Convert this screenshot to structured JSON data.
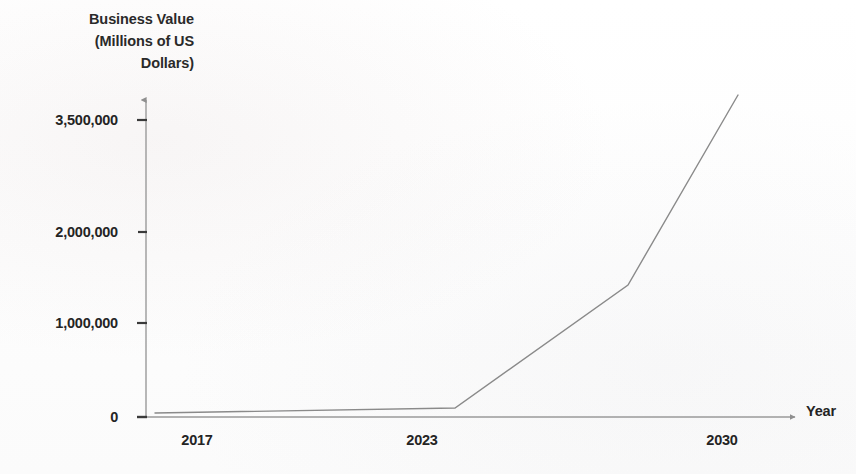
{
  "chart_data": {
    "type": "line",
    "title": "Business Value (Millions of US Dollars)",
    "ylabel_lines": [
      "Business Value",
      "(Millions of US",
      "Dollars)"
    ],
    "xlabel": "Year",
    "ylabel": "Business Value (Millions of US Dollars)",
    "grid": false,
    "legend": "none",
    "x_tick_labels": [
      "2017",
      "2023",
      "2030"
    ],
    "x_tick_values": [
      2017,
      2023,
      2030
    ],
    "y_tick_labels": [
      "0",
      "1,000,000",
      "2,000,000",
      "3,500,000"
    ],
    "y_tick_values": [
      0,
      1000000,
      2000000,
      3500000
    ],
    "y_tick_spacing": "non-linear",
    "ylim": [
      0,
      3700000
    ],
    "xlim": [
      2016,
      2032
    ],
    "series": [
      {
        "name": "Business Value",
        "x": [
          2016.3,
          2023.6,
          2028.1,
          2031.0
        ],
        "y": [
          20000,
          110000,
          1450000,
          3680000
        ],
        "color": "#8a8a8a"
      }
    ],
    "annotations": [],
    "points_px": [
      {
        "x": 155,
        "y": 413
      },
      {
        "x": 455,
        "y": 408
      },
      {
        "x": 628,
        "y": 285
      },
      {
        "x": 738,
        "y": 95
      }
    ]
  },
  "axes": {
    "origin_px": {
      "x": 146,
      "y": 417
    },
    "y_axis_top_px": 97,
    "x_axis_end_px": 800,
    "y_ticks_px": [
      {
        "label": "3,500,000",
        "y": 120
      },
      {
        "label": "2,000,000",
        "y": 232
      },
      {
        "label": "1,000,000",
        "y": 323
      },
      {
        "label": "0",
        "y": 417
      }
    ],
    "x_ticks_px": [
      {
        "label": "2017",
        "x": 197
      },
      {
        "label": "2023",
        "x": 422
      },
      {
        "label": "2030",
        "x": 722
      }
    ],
    "axis_color": "#8f8f8f",
    "line_color": "#8a8a8a"
  },
  "watermark": {
    "lines": [
      "",
      ""
    ]
  }
}
